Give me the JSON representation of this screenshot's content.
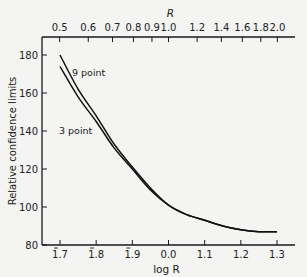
{
  "chart_data": {
    "type": "line",
    "title": "",
    "xlabel": "log R",
    "ylabel": "Relative confidence limits",
    "x2label": "R",
    "xlim": [
      -0.3,
      0.3
    ],
    "ylim": [
      80,
      190
    ],
    "grid": false,
    "y_ticks": [
      80,
      100,
      120,
      140,
      160,
      180
    ],
    "x_ticks": [
      {
        "value": -0.3,
        "label": "1.7",
        "bar": true
      },
      {
        "value": -0.2,
        "label": "1.8",
        "bar": true
      },
      {
        "value": -0.1,
        "label": "1.9",
        "bar": true
      },
      {
        "value": 0.0,
        "label": "0.0",
        "bar": false
      },
      {
        "value": 0.1,
        "label": "1.1",
        "bar": false
      },
      {
        "value": 0.2,
        "label": "1.2",
        "bar": false
      },
      {
        "value": 0.3,
        "label": "1.3",
        "bar": false
      }
    ],
    "x2_ticks": [
      {
        "value": 0.5,
        "label": "0.5"
      },
      {
        "value": 0.6,
        "label": "0.6"
      },
      {
        "value": 0.7,
        "label": "0.7"
      },
      {
        "value": 0.8,
        "label": "0.8"
      },
      {
        "value": 0.9,
        "label": "0.9"
      },
      {
        "value": 1.0,
        "label": "1.0"
      },
      {
        "value": 1.2,
        "label": "1.2"
      },
      {
        "value": 1.4,
        "label": "1.4"
      },
      {
        "value": 1.6,
        "label": "1.6"
      },
      {
        "value": 1.8,
        "label": "1.8"
      },
      {
        "value": 2.0,
        "label": "2.0"
      }
    ],
    "x": [
      -0.3,
      -0.25,
      -0.2,
      -0.15,
      -0.1,
      -0.05,
      0.0,
      0.05,
      0.1,
      0.15,
      0.2,
      0.25,
      0.3
    ],
    "series": [
      {
        "name": "9 point",
        "values": [
          180,
          162,
          148,
          133,
          121,
          110,
          101,
          96,
          93,
          90,
          88,
          87,
          87
        ]
      },
      {
        "name": "3 point",
        "values": [
          174,
          158,
          145,
          131,
          120,
          109,
          101,
          96,
          93,
          90,
          88,
          87,
          87
        ]
      }
    ],
    "annotations": [
      {
        "text": "9 point",
        "series": "9 point"
      },
      {
        "text": "3 point",
        "series": "3 point"
      }
    ],
    "legend": "inline labels"
  }
}
